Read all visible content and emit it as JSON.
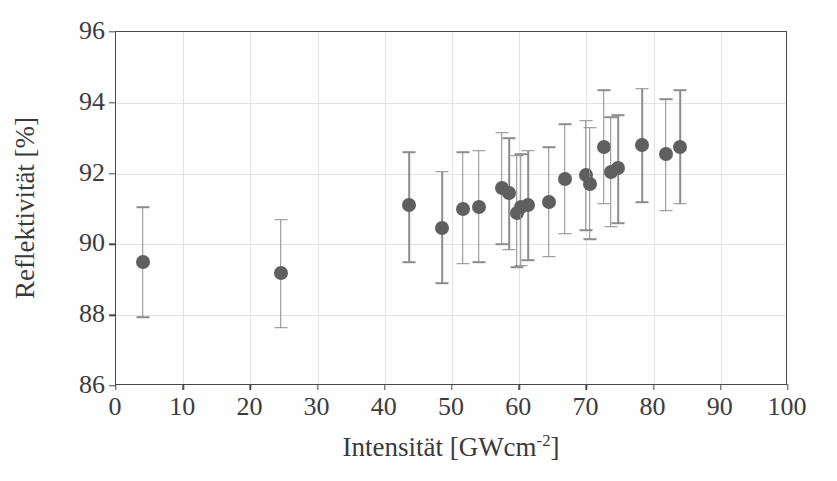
{
  "chart_data": {
    "type": "scatter",
    "title": "",
    "xlabel": "Intensität [GWcm⁻²]",
    "xlabel_base": "Intensität [GWcm",
    "xlabel_exponent": "-2",
    "xlabel_tail": "]",
    "ylabel": "Reflektivität [%]",
    "xlim": [
      0,
      100
    ],
    "ylim": [
      86,
      96
    ],
    "xticks": [
      0,
      10,
      20,
      30,
      40,
      50,
      60,
      70,
      80,
      90,
      100
    ],
    "yticks": [
      86,
      88,
      90,
      92,
      94,
      96
    ],
    "grid": true,
    "legend": "none",
    "marker_color": "#5f5f5f",
    "errorbar_color": "#8c8c8c",
    "axis_color": "#4a4a4a",
    "grid_color": "#e3e3e3",
    "series": [
      {
        "name": "Reflektivität",
        "points": [
          {
            "x": 4.0,
            "y": 89.5,
            "ylow": 87.95,
            "yhigh": 91.05
          },
          {
            "x": 24.5,
            "y": 89.2,
            "ylow": 87.65,
            "yhigh": 90.7
          },
          {
            "x": 43.6,
            "y": 91.1,
            "ylow": 89.5,
            "yhigh": 92.6
          },
          {
            "x": 48.5,
            "y": 90.45,
            "ylow": 88.9,
            "yhigh": 92.05
          },
          {
            "x": 51.6,
            "y": 91.0,
            "ylow": 89.45,
            "yhigh": 92.6
          },
          {
            "x": 54.0,
            "y": 91.05,
            "ylow": 89.5,
            "yhigh": 92.65
          },
          {
            "x": 57.4,
            "y": 91.6,
            "ylow": 90.0,
            "yhigh": 93.15
          },
          {
            "x": 58.5,
            "y": 91.45,
            "ylow": 89.85,
            "yhigh": 93.0
          },
          {
            "x": 59.6,
            "y": 90.9,
            "ylow": 89.35,
            "yhigh": 92.5
          },
          {
            "x": 60.2,
            "y": 91.05,
            "ylow": 89.4,
            "yhigh": 92.55
          },
          {
            "x": 61.3,
            "y": 91.1,
            "ylow": 89.55,
            "yhigh": 92.65
          },
          {
            "x": 64.4,
            "y": 91.2,
            "ylow": 89.65,
            "yhigh": 92.75
          },
          {
            "x": 66.8,
            "y": 91.85,
            "ylow": 90.3,
            "yhigh": 93.4
          },
          {
            "x": 69.9,
            "y": 91.95,
            "ylow": 90.4,
            "yhigh": 93.5
          },
          {
            "x": 70.5,
            "y": 91.7,
            "ylow": 90.15,
            "yhigh": 93.3
          },
          {
            "x": 72.6,
            "y": 92.75,
            "ylow": 91.15,
            "yhigh": 94.35
          },
          {
            "x": 73.6,
            "y": 92.05,
            "ylow": 90.5,
            "yhigh": 93.6
          },
          {
            "x": 74.7,
            "y": 92.15,
            "ylow": 90.6,
            "yhigh": 93.65
          },
          {
            "x": 78.3,
            "y": 92.8,
            "ylow": 91.2,
            "yhigh": 94.4
          },
          {
            "x": 81.8,
            "y": 92.55,
            "ylow": 90.95,
            "yhigh": 94.1
          },
          {
            "x": 84.0,
            "y": 92.75,
            "ylow": 91.15,
            "yhigh": 94.35
          }
        ]
      }
    ]
  }
}
